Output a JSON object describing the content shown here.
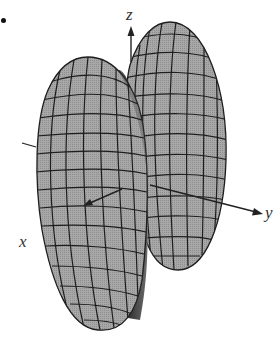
{
  "figure": {
    "bullet": "•",
    "axes": {
      "z": {
        "label": "z"
      },
      "y": {
        "label": "y"
      },
      "x": {
        "label": "x"
      }
    },
    "colors": {
      "surface_light": "#a9a9a9",
      "surface_mid": "#8c8c8c",
      "surface_dark": "#3a3a3a",
      "mesh": "#1e1e1e",
      "axis": "#222222",
      "background": "#ffffff"
    }
  }
}
